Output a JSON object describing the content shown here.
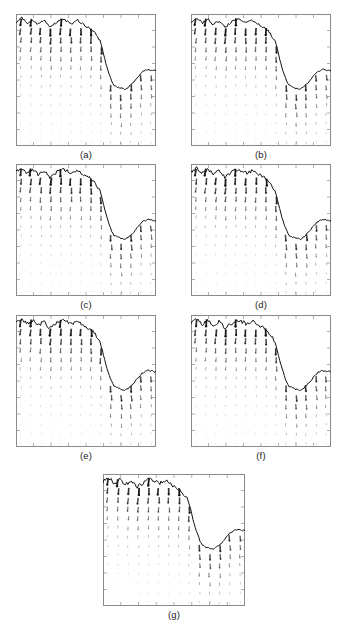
{
  "figure": {
    "type": "vector-field-panel-array",
    "width": 348,
    "height": 634,
    "background": "#ffffff",
    "frame_color": "#8a8a8a",
    "interface_color": "#111111",
    "vector_color": "#1a1a1a",
    "panel_layout": "2-2-2-1",
    "panels": [
      {
        "id": "a",
        "label": "(a)",
        "x": 16,
        "y": 14,
        "w": 140,
        "h": 132
      },
      {
        "id": "b",
        "label": "(b)",
        "x": 191,
        "y": 14,
        "w": 140,
        "h": 132
      },
      {
        "id": "c",
        "label": "(c)",
        "x": 16,
        "y": 164,
        "w": 140,
        "h": 132
      },
      {
        "id": "d",
        "label": "(d)",
        "x": 191,
        "y": 164,
        "w": 140,
        "h": 132
      },
      {
        "id": "e",
        "label": "(e)",
        "x": 16,
        "y": 315,
        "w": 140,
        "h": 132
      },
      {
        "id": "f",
        "label": "(f)",
        "x": 191,
        "y": 315,
        "w": 140,
        "h": 132
      },
      {
        "id": "g",
        "label": "(g)",
        "x": 103,
        "y": 474,
        "w": 142,
        "h": 132
      }
    ]
  },
  "chart_data": {
    "type": "scatter",
    "title": "",
    "xlabel": "",
    "ylabel": "",
    "xlim": [
      0,
      1
    ],
    "ylim": [
      0,
      1
    ],
    "grid": false,
    "legend": null,
    "vector_grid": {
      "nx": 14,
      "ny": 14,
      "arrow_direction": "downward",
      "magnitude_profile": "decays with depth"
    },
    "interface_profile": {
      "x": [
        0.0,
        0.04,
        0.08,
        0.12,
        0.16,
        0.2,
        0.24,
        0.28,
        0.32,
        0.36,
        0.4,
        0.44,
        0.48,
        0.52,
        0.56,
        0.6,
        0.62,
        0.64,
        0.66,
        0.68,
        0.7,
        0.74,
        0.78,
        0.82,
        0.86,
        0.9,
        0.94,
        1.0
      ],
      "y": [
        0.94,
        0.97,
        0.93,
        0.96,
        0.92,
        0.95,
        0.9,
        0.93,
        0.96,
        0.95,
        0.93,
        0.95,
        0.92,
        0.9,
        0.86,
        0.8,
        0.72,
        0.63,
        0.56,
        0.5,
        0.46,
        0.44,
        0.43,
        0.46,
        0.51,
        0.56,
        0.58,
        0.57
      ]
    },
    "panel_series": [
      {
        "name": "(a)",
        "crest_level": 0.94,
        "valley_level": 0.44,
        "interface_sharpness": 0.86
      },
      {
        "name": "(b)",
        "crest_level": 0.94,
        "valley_level": 0.45,
        "interface_sharpness": 0.88
      },
      {
        "name": "(c)",
        "crest_level": 0.93,
        "valley_level": 0.43,
        "interface_sharpness": 0.9
      },
      {
        "name": "(d)",
        "crest_level": 0.94,
        "valley_level": 0.44,
        "interface_sharpness": 0.91
      },
      {
        "name": "(e)",
        "crest_level": 0.93,
        "valley_level": 0.45,
        "interface_sharpness": 0.92
      },
      {
        "name": "(f)",
        "crest_level": 0.94,
        "valley_level": 0.44,
        "interface_sharpness": 0.93
      },
      {
        "name": "(g)",
        "crest_level": 0.94,
        "valley_level": 0.44,
        "interface_sharpness": 0.94
      }
    ]
  }
}
